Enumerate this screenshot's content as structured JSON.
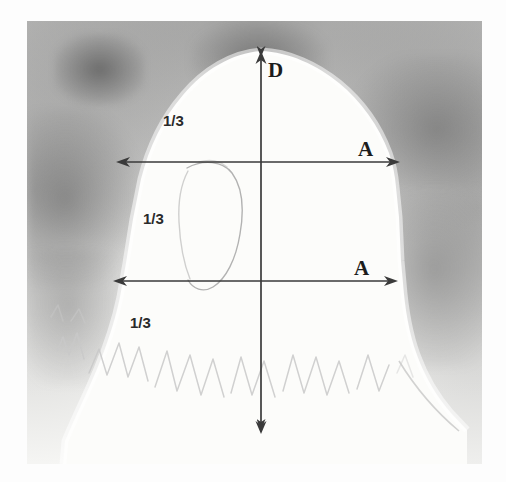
{
  "figure": {
    "medium": "pencil-drawing",
    "background_color": "#8d8d8d",
    "paper_color": "#fbfbf9",
    "ink_color": "#3a3a3a"
  },
  "annotations": {
    "vertical_axis": {
      "label": "D",
      "name": "depth-axis",
      "arrow": "double-headed-vertical",
      "x": 261,
      "y_top": 51,
      "y_bottom": 434
    },
    "horizontal_axes": [
      {
        "label": "A",
        "name": "upper-width-axis",
        "arrow": "double-headed-horizontal",
        "y": 162,
        "x_left": 116,
        "x_right": 400
      },
      {
        "label": "A",
        "name": "lower-width-axis",
        "arrow": "double-headed-horizontal",
        "y": 281,
        "x_left": 113,
        "x_right": 398
      }
    ],
    "divisions": [
      {
        "label": "1/3",
        "name": "upper-third",
        "x": 163,
        "y": 113
      },
      {
        "label": "1/3",
        "name": "middle-third",
        "x": 143,
        "y": 211
      },
      {
        "label": "1/3",
        "name": "lower-third",
        "x": 130,
        "y": 315
      }
    ]
  },
  "drawing_elements": {
    "head_outline": "rear-view-head-silhouette",
    "ear_outline": "faint-ear-contour",
    "hair_texture": "zigzag-pencil-strokes",
    "shoulder": "right-shoulder-slope"
  }
}
